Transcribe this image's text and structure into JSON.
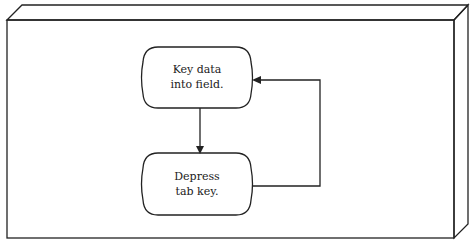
{
  "diagram": {
    "type": "flowchart",
    "frame": "3d-panel",
    "nodes": [
      {
        "id": "n1",
        "shape": "terminal",
        "lines": [
          "Key data",
          "into field."
        ]
      },
      {
        "id": "n2",
        "shape": "terminal",
        "lines": [
          "Depress",
          "tab key."
        ]
      }
    ],
    "edges": [
      {
        "from": "n1",
        "to": "n2",
        "direction": "down"
      },
      {
        "from": "n2",
        "to": "n1",
        "route": "right-loop-back"
      }
    ],
    "colors": {
      "stroke": "#222222",
      "background": "#ffffff"
    }
  }
}
